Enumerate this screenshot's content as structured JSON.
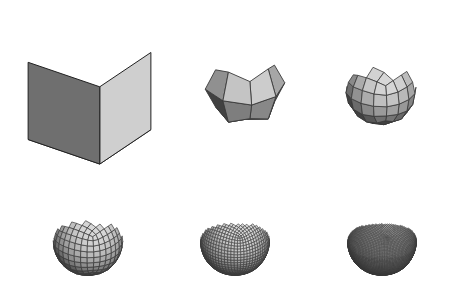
{
  "figure": {
    "background_color": "#ffffff",
    "width": 451,
    "height": 306,
    "caption": ""
  },
  "palette": {
    "top_face": "#d6d6d6",
    "right_face": "#cfcfcf",
    "left_face": "#6f6f6f",
    "shadow_face": "#2a2a2a",
    "edge_stroke": "#3a3a3a",
    "outline_stroke": "#222222",
    "background": "#ffffff"
  },
  "lighting": {
    "direction": "upper-right",
    "highlight_value": "#e2e2e2",
    "midtone_value": "#b4b4b4",
    "shadow_value": "#5a5a5a"
  },
  "panels": [
    {
      "id": "panel-1",
      "label": "cube",
      "subdivision_level": 0,
      "shape": "cube",
      "faces_visible": 3,
      "grid_divisions": 1,
      "edge_width": 1.0,
      "x": 27,
      "y": 12,
      "width": 125,
      "height": 160,
      "fill_top": "#d6d6d6",
      "fill_right": "#cfcfcf",
      "fill_left": "#6f6f6f"
    },
    {
      "id": "panel-2",
      "label": "subdivision 1",
      "subdivision_level": 1,
      "shape": "rounded-cube-faceted",
      "faces_visible": 13,
      "grid_divisions": 2,
      "edge_width": 0.9,
      "x": 196,
      "y": 30,
      "width": 98,
      "height": 112,
      "fill_top": "#d2d2d2",
      "fill_right": "#c8c8c8",
      "fill_left": "#6b6b6b"
    },
    {
      "id": "panel-3",
      "label": "subdivision 2",
      "subdivision_level": 2,
      "shape": "rounded-cube",
      "faces_visible": 48,
      "grid_divisions": 4,
      "edge_width": 0.8,
      "x": 331,
      "y": 34,
      "width": 100,
      "height": 112,
      "fill_top": "#cfcfcf",
      "fill_right": "#c4c4c4",
      "fill_left": "#707070"
    },
    {
      "id": "panel-4",
      "label": "subdivision 3",
      "subdivision_level": 3,
      "shape": "rounded-cube",
      "faces_visible": 192,
      "grid_divisions": 8,
      "edge_width": 0.7,
      "x": 36,
      "y": 186,
      "width": 104,
      "height": 110,
      "fill_top": "#cbcbcb",
      "fill_right": "#c0c0c0",
      "fill_left": "#6e6e6e"
    },
    {
      "id": "panel-5",
      "label": "subdivision 4",
      "subdivision_level": 4,
      "shape": "rounded-cube",
      "faces_visible": 768,
      "grid_divisions": 16,
      "edge_width": 0.6,
      "x": 183,
      "y": 186,
      "width": 104,
      "height": 110,
      "fill_top": "#c4c4c4",
      "fill_right": "#b8b8b8",
      "fill_left": "#6a6a6a"
    },
    {
      "id": "panel-6",
      "label": "subdivision 5",
      "subdivision_level": 5,
      "shape": "rounded-cube",
      "faces_visible": 3072,
      "grid_divisions": 30,
      "edge_width": 0.5,
      "x": 330,
      "y": 186,
      "width": 104,
      "height": 110,
      "fill_top": "#9e9e9e",
      "fill_right": "#8f8f8f",
      "fill_left": "#4e4e4e"
    }
  ]
}
